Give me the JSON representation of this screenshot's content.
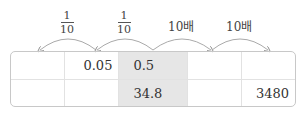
{
  "arrows": [
    {
      "type": "fraction",
      "numerator": "1",
      "denominator": "10",
      "direction": "left"
    },
    {
      "type": "fraction",
      "numerator": "1",
      "denominator": "10",
      "direction": "left"
    },
    {
      "type": "text",
      "label": "10배",
      "direction": "right"
    },
    {
      "type": "text",
      "label": "10배",
      "direction": "right"
    }
  ],
  "table": {
    "rows": [
      [
        "",
        "0.05",
        "0.5",
        "",
        ""
      ],
      [
        "",
        "",
        "34.8",
        "",
        "3480"
      ]
    ],
    "highlight_column": 2,
    "highlight_color": "#e6e6e6"
  }
}
